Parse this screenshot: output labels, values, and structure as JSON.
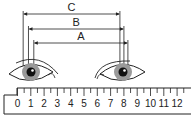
{
  "diagram": {
    "measurements": [
      {
        "label": "C",
        "from_ruler": 0.2,
        "to_ruler": 7.4
      },
      {
        "label": "B",
        "from_ruler": 0.6,
        "to_ruler": 7.7
      },
      {
        "label": "A",
        "from_ruler": 1.0,
        "to_ruler": 8.0
      }
    ],
    "ruler": {
      "labels": [
        "0",
        "1",
        "2",
        "3",
        "4",
        "5",
        "6",
        "7",
        "8",
        "9",
        "10",
        "11",
        "12"
      ],
      "minor_per_major": 2
    },
    "colors": {
      "line": "#222222",
      "iris": "#9a9a9a",
      "pupil": "#111111"
    }
  }
}
